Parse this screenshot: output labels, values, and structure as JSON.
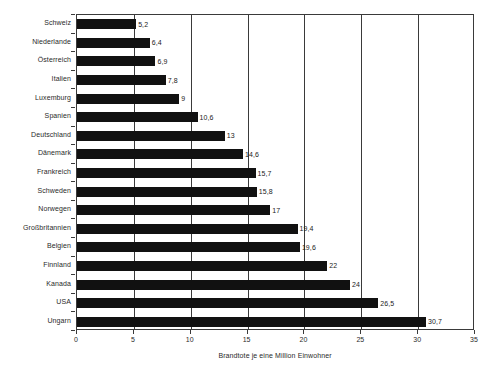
{
  "chart_data": {
    "type": "bar",
    "orientation": "horizontal",
    "title": "",
    "xlabel": "Brandtote je eine Million Einwohner",
    "ylabel": "",
    "xlim": [
      0,
      35
    ],
    "xticks": [
      0,
      5,
      10,
      15,
      20,
      25,
      30,
      35
    ],
    "grid": true,
    "legend": false,
    "bar_color": "#111111",
    "categories": [
      "Schweiz",
      "Niederlande",
      "Österreich",
      "Italien",
      "Luxemburg",
      "Spanien",
      "Deutschland",
      "Dänemark",
      "Frankreich",
      "Schweden",
      "Norwegen",
      "Großbritannien",
      "Belgien",
      "Finnland",
      "Kanada",
      "USA",
      "Ungarn"
    ],
    "values": [
      5.2,
      6.4,
      6.9,
      7.8,
      9,
      10.6,
      13,
      14.6,
      15.7,
      15.8,
      17,
      19.4,
      19.6,
      22,
      24,
      26.5,
      30.7
    ],
    "value_labels": [
      "5,2",
      "6,4",
      "6,9",
      "7,8",
      "9",
      "10,6",
      "13",
      "14,6",
      "15,7",
      "15,8",
      "17",
      "19,4",
      "19,6",
      "22",
      "24",
      "26,5",
      "30,7"
    ],
    "xtick_labels": [
      "0",
      "5",
      "10",
      "15",
      "20",
      "25",
      "30",
      "35"
    ]
  }
}
